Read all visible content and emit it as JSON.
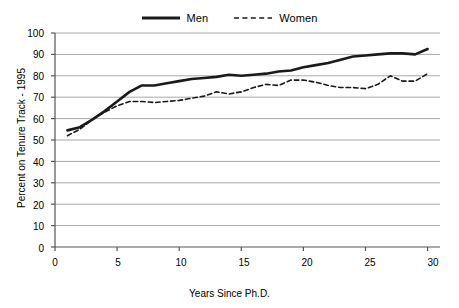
{
  "legend": {
    "position": "top-center",
    "entries": [
      {
        "label": "Men",
        "style": "solid",
        "color": "#1a1a1a",
        "icon": "solid-line-swatch-icon"
      },
      {
        "label": "Women",
        "style": "dashed",
        "color": "#1a1a1a",
        "icon": "dashed-line-swatch-icon"
      }
    ]
  },
  "axes": {
    "y_title": "Percent on Tenure Track - 1995",
    "x_title": "Years Since Ph.D.",
    "y_ticks": [
      "0",
      "10",
      "20",
      "30",
      "40",
      "50",
      "60",
      "70",
      "80",
      "90",
      "100"
    ],
    "x_ticks": [
      "0",
      "5",
      "10",
      "15",
      "20",
      "25",
      "30"
    ]
  },
  "colors": {
    "line": "#1a1a1a",
    "gridline": "#a8a8a8",
    "axis": "#555555",
    "background": "#ffffff"
  },
  "chart_data": {
    "type": "line",
    "title": "",
    "subtitle": "",
    "xlabel": "Years Since Ph.D.",
    "ylabel": "Percent on Tenure Track - 1995",
    "xlim": [
      0,
      31
    ],
    "ylim": [
      0,
      100
    ],
    "x_ticks": [
      0,
      5,
      10,
      15,
      20,
      25,
      30
    ],
    "y_ticks": [
      0,
      10,
      20,
      30,
      40,
      50,
      60,
      70,
      80,
      90,
      100
    ],
    "grid": "horizontal",
    "legend_position": "top-center",
    "x": [
      1,
      2,
      3,
      4,
      5,
      6,
      7,
      8,
      9,
      10,
      11,
      12,
      13,
      14,
      15,
      16,
      17,
      18,
      19,
      20,
      21,
      22,
      23,
      24,
      25,
      26,
      27,
      28,
      29,
      30
    ],
    "series": [
      {
        "name": "Men",
        "style": "solid",
        "color": "#1a1a1a",
        "values": [
          54.5,
          56.0,
          59.5,
          63.5,
          68.0,
          72.5,
          75.5,
          75.5,
          76.5,
          77.5,
          78.5,
          79.0,
          79.5,
          80.5,
          80.0,
          80.5,
          81.0,
          82.0,
          82.5,
          84.0,
          85.0,
          86.0,
          87.5,
          89.0,
          89.5,
          90.0,
          90.5,
          90.5,
          90.0,
          92.5
        ]
      },
      {
        "name": "Women",
        "style": "dashed",
        "color": "#1a1a1a",
        "values": [
          52.0,
          55.0,
          59.5,
          63.0,
          66.0,
          68.0,
          68.0,
          67.5,
          68.0,
          68.5,
          69.5,
          70.5,
          72.5,
          71.5,
          72.5,
          74.5,
          76.0,
          75.5,
          78.0,
          78.0,
          77.0,
          75.5,
          74.5,
          74.5,
          74.0,
          76.0,
          80.0,
          77.5,
          77.5,
          81.0
        ]
      }
    ]
  }
}
